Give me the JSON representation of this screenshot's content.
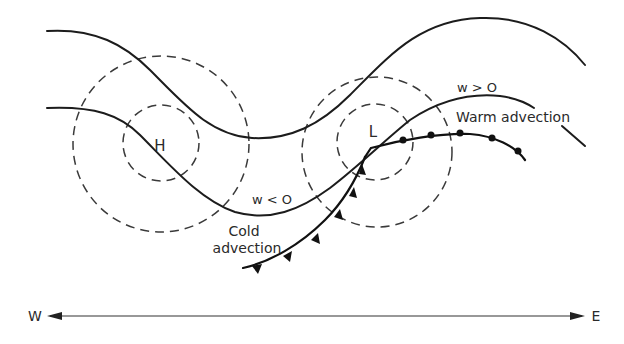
{
  "diagram": {
    "title": "",
    "pressure_centers": {
      "high": "H",
      "low": "L"
    },
    "annotations": {
      "warm_w": "w > O",
      "warm_label": "Warm advection",
      "cold_w": "w < O",
      "cold_label_line1": "Cold",
      "cold_label_line2": "advection"
    },
    "axis": {
      "west": "W",
      "east": "E"
    },
    "colors": {
      "line": "#1c1c1c",
      "dashed": "#3a3a3a",
      "background": "#ffffff"
    }
  }
}
